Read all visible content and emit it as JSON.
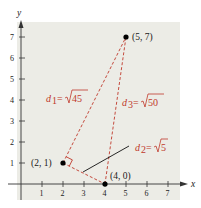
{
  "diagram": {
    "axes": {
      "x_label": "x",
      "y_label": "y",
      "x_ticks": [
        "1",
        "2",
        "3",
        "4",
        "5",
        "6",
        "7"
      ],
      "y_ticks": [
        "1",
        "2",
        "3",
        "4",
        "5",
        "6",
        "7"
      ]
    },
    "points": [
      {
        "label": "(5, 7)",
        "x": 5,
        "y": 7
      },
      {
        "label": "(2, 1)",
        "x": 2,
        "y": 1
      },
      {
        "label": "(4, 0)",
        "x": 4,
        "y": 0
      }
    ],
    "distances": {
      "d1": {
        "name": "d",
        "sub": "1",
        "eq": "=",
        "value": "45"
      },
      "d2": {
        "name": "d",
        "sub": "2",
        "eq": "=",
        "value": "5"
      },
      "d3": {
        "name": "d",
        "sub": "3",
        "eq": "=",
        "value": "50"
      }
    },
    "colors": {
      "background_panel": "#ecece6",
      "dashed_line": "#c0392b",
      "label_red": "#c0392b",
      "axis": "#333333"
    }
  }
}
